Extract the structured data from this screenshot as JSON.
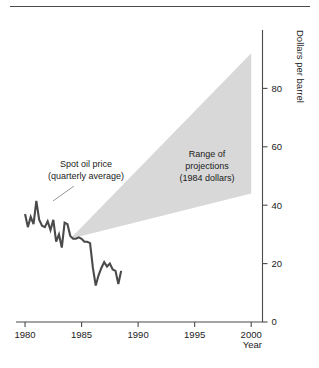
{
  "chart_data": {
    "type": "line",
    "title": "",
    "xlabel": "Year",
    "ylabel": "Dollars per barrel",
    "xlim": [
      1979.2,
      2001.0
    ],
    "ylim": [
      0,
      100
    ],
    "grid": false,
    "legend_position": "none",
    "xticks": [
      1980,
      1985,
      1990,
      1995,
      2000
    ],
    "xtick_labels": [
      "1980",
      "1985",
      "1990",
      "1995",
      "2000"
    ],
    "yticks": [
      0,
      20,
      40,
      60,
      80
    ],
    "ytick_labels": [
      "0",
      "20",
      "40",
      "60",
      "80"
    ],
    "series": [
      {
        "name": "Spot oil price (quarterly average)",
        "color": "#4a4a4a",
        "x": [
          1980.0,
          1980.25,
          1980.5,
          1980.75,
          1981.0,
          1981.25,
          1981.5,
          1981.75,
          1982.0,
          1982.25,
          1982.5,
          1982.75,
          1983.0,
          1983.25,
          1983.5,
          1983.75,
          1984.0,
          1984.25,
          1984.5,
          1984.75,
          1985.0,
          1985.25,
          1985.5,
          1985.75,
          1986.0,
          1986.25,
          1986.5,
          1986.75,
          1987.0,
          1987.25,
          1987.5,
          1987.75,
          1988.0,
          1988.25,
          1988.5
        ],
        "y": [
          37.0,
          32.5,
          36.0,
          33.5,
          41.5,
          35.0,
          33.0,
          32.5,
          34.5,
          31.5,
          35.0,
          27.5,
          30.0,
          25.5,
          34.0,
          33.5,
          29.5,
          28.5,
          28.5,
          29.0,
          28.5,
          27.5,
          27.5,
          27.0,
          18.5,
          12.5,
          16.0,
          18.5,
          20.5,
          19.0,
          20.0,
          18.0,
          17.5,
          13.0,
          17.5
        ]
      }
    ],
    "shaded_region": {
      "name": "Range of projections (1984 dollars)",
      "color": "#d8d8d8",
      "apex": {
        "x": 1984.0,
        "y": 28.5
      },
      "upper_end": {
        "x": 2000.0,
        "y": 92.0
      },
      "lower_end": {
        "x": 2000.0,
        "y": 44.0
      }
    },
    "annotations": [
      {
        "name": "spot-oil-price-annotation",
        "lines": [
          "Spot oil price",
          "(quarterly average)"
        ],
        "text": "Spot oil price (quarterly average)",
        "x": 1981.6,
        "y": 52.0
      },
      {
        "name": "range-of-projections-annotation",
        "lines": [
          "Range of",
          "projections",
          "(1984 dollars)"
        ],
        "text": "Range of projections (1984 dollars)",
        "x": 1992.0,
        "y": 50.0
      }
    ]
  },
  "annotations": {
    "spot": {
      "line1": "Spot oil price",
      "line2": "(quarterly average)"
    },
    "projections": {
      "line1": "Range of",
      "line2": "projections",
      "line3": "(1984 dollars)"
    }
  },
  "axes": {
    "x_title": "Year",
    "y_title": "Dollars per barrel",
    "x_labels": [
      "1980",
      "1985",
      "1990",
      "1995",
      "2000"
    ],
    "y_labels": [
      "0",
      "20",
      "40",
      "60",
      "80"
    ]
  },
  "colors": {
    "line": "#4a4a4a",
    "shade": "#d8d8d8",
    "axis": "#4a4a4a",
    "text": "#1b1b1b",
    "background": "#ffffff"
  }
}
